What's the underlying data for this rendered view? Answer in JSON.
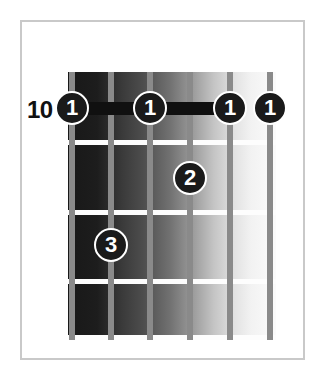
{
  "diagram": {
    "type": "guitar-chord-diagram",
    "start_fret_label": "10",
    "string_count": 6,
    "fret_count": 4,
    "colors": {
      "frame": "#c9c9c9",
      "marker_fill": "#1a1a1a",
      "marker_text": "#ffffff",
      "barre": "#101010",
      "fret_wire": "#fdfdfd",
      "string": "#8a8a8a",
      "background": "#ffffff"
    },
    "geometry": {
      "board_left": 68,
      "board_top": 72,
      "board_width": 208,
      "board_height": 268
    },
    "strings_x": [
      72,
      111,
      150,
      190,
      230,
      270
    ],
    "frets_y": [
      140,
      210,
      279,
      335
    ],
    "markers": [
      {
        "finger": "1",
        "string_index": 0,
        "x": 72,
        "y": 108
      },
      {
        "finger": "1",
        "string_index": 2,
        "x": 150,
        "y": 108
      },
      {
        "finger": "1",
        "string_index": 4,
        "x": 230,
        "y": 108
      },
      {
        "finger": "1",
        "string_index": 5,
        "x": 270,
        "y": 108
      },
      {
        "finger": "2",
        "string_index": 3,
        "x": 190,
        "y": 178
      },
      {
        "finger": "3",
        "string_index": 1,
        "x": 111,
        "y": 245
      }
    ],
    "barres": [
      {
        "x": 72,
        "y": 102,
        "width": 78
      },
      {
        "x": 150,
        "y": 102,
        "width": 80
      }
    ],
    "fret_number_position": {
      "x": 27,
      "y": 96
    }
  }
}
